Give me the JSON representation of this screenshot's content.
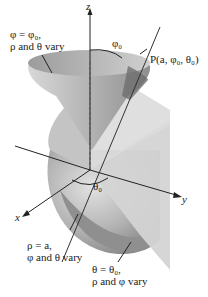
{
  "diagram": {
    "axes": {
      "z": "z",
      "y": "y",
      "x": "x"
    },
    "labels": {
      "cone_line1": "φ = φ₀,",
      "cone_line2": "ρ and θ vary",
      "phi0": "φ₀",
      "point": "P(a, φ₀, θ₀)",
      "theta0": "θ₀",
      "sphere_line1": "ρ = a,",
      "sphere_line2": "φ and θ vary",
      "plane_line1": "θ = θ₀,",
      "plane_line2": "ρ and φ vary"
    },
    "colors": {
      "cone_outer": "#c8c8c8",
      "cone_inner": "#a9a9a9",
      "sphere": "#b5b5b5",
      "sphere_dark": "#8e8e8e",
      "plane": "#d6d6d6",
      "axis": "#222222",
      "background": "#ffffff"
    }
  }
}
